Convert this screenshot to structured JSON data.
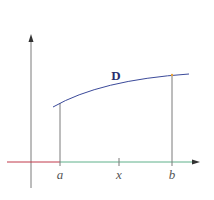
{
  "diagram": {
    "curve_label": "D",
    "x_labels": {
      "a": "a",
      "x": "x",
      "b": "b"
    },
    "colors": {
      "axis": "#7a7a7a",
      "x_axis_left": "#c0394a",
      "x_axis_right": "#5fb08a",
      "curve": "#3b4a9a",
      "curve_label": "#2a2f6e",
      "verticals": "#7a7a7a",
      "labels": "#555555"
    }
  }
}
